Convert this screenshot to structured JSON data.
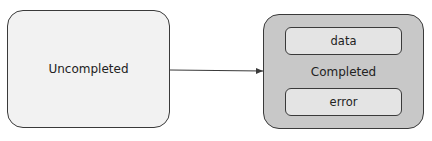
{
  "diagram": {
    "nodes": {
      "uncompleted": {
        "label": "Uncompleted"
      },
      "completed": {
        "label": "Completed",
        "children": {
          "data": {
            "label": "data"
          },
          "error": {
            "label": "error"
          }
        }
      }
    },
    "edges": [
      {
        "from": "uncompleted",
        "to": "completed",
        "label": ""
      }
    ],
    "colors": {
      "uncompleted_fill": "#f2f2f2",
      "completed_fill": "#c8c8c8",
      "inner_fill": "#e4e4e4",
      "stroke": "#3a3a3a"
    }
  }
}
